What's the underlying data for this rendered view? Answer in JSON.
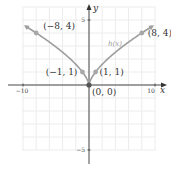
{
  "chart_data": {
    "type": "line",
    "title": "",
    "xlabel": "x",
    "ylabel": "y",
    "xlim": [
      -10,
      10
    ],
    "ylim": [
      -5,
      5
    ],
    "grid": true,
    "x_tick_labels": [
      "−10",
      "10"
    ],
    "y_tick_labels": [
      "5",
      "−5"
    ],
    "series": [
      {
        "name": "h(x)",
        "function": "h(x) = |x|^(2/3)",
        "color": "#9e9e9e",
        "points": [
          {
            "x": -8,
            "y": 4,
            "label": "(−8, 4)"
          },
          {
            "x": -1,
            "y": 1,
            "label": "(−1, 1)"
          },
          {
            "x": 0,
            "y": 0,
            "label": "(0, 0)"
          },
          {
            "x": 1,
            "y": 1,
            "label": "(1, 1)"
          },
          {
            "x": 8,
            "y": 4,
            "label": "(8, 4)"
          }
        ]
      }
    ],
    "curve_label": "h(x)"
  }
}
